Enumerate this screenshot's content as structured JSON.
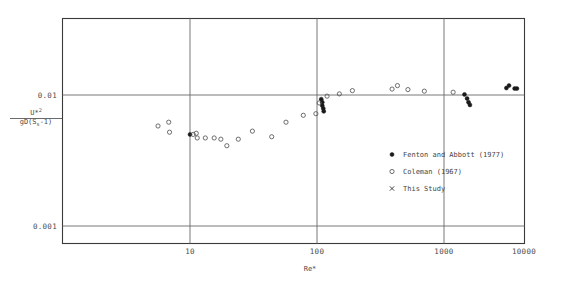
{
  "chart_data": {
    "type": "scatter",
    "title": "",
    "xlabel": "Re*",
    "ylabel_numerator": "U*",
    "ylabel_numerator_exp": "2",
    "ylabel_denominator_pre": "gD(S",
    "ylabel_denominator_sub": "s",
    "ylabel_denominator_post": "-1)",
    "xscale": "log",
    "yscale": "log",
    "xlim": [
      3,
      10000
    ],
    "ylim": [
      0.0007,
      0.05
    ],
    "grid": true,
    "legend_position": "center-right",
    "xticks": [
      "10",
      "100",
      "1000",
      "10000"
    ],
    "xtick_values": [
      10,
      100,
      1000,
      10000
    ],
    "yticks": [
      "0.01",
      "0.001"
    ],
    "ytick_values": [
      0.01,
      0.001
    ],
    "series": [
      {
        "name": "Fenton and Abbott (1977)",
        "marker": "filled-circle",
        "color": "#1a1a1a",
        "points": [
          [
            10.0,
            0.005
          ],
          [
            108.0,
            0.0093
          ],
          [
            110.0,
            0.0088
          ],
          [
            110.0,
            0.0083
          ],
          [
            112.0,
            0.0079
          ],
          [
            113.0,
            0.0075
          ],
          [
            1450.0,
            0.0101
          ],
          [
            1520.0,
            0.0094
          ],
          [
            1560.0,
            0.0088
          ],
          [
            1600.0,
            0.0084
          ],
          [
            3100.0,
            0.0113
          ],
          [
            3250.0,
            0.0118
          ],
          [
            3600.0,
            0.0112
          ],
          [
            3750.0,
            0.0112
          ]
        ]
      },
      {
        "name": "Coleman (1967)",
        "marker": "open-circle",
        "color": "#555555",
        "points": [
          [
            5.6,
            0.0058
          ],
          [
            6.8,
            0.0062
          ],
          [
            6.9,
            0.0052
          ],
          [
            10.6,
            0.005
          ],
          [
            11.2,
            0.0051
          ],
          [
            11.4,
            0.0047
          ],
          [
            13.2,
            0.0047
          ],
          [
            15.5,
            0.0047
          ],
          [
            17.5,
            0.0046
          ],
          [
            19.5,
            0.0041
          ],
          [
            24.0,
            0.0046
          ],
          [
            31.0,
            0.0053
          ],
          [
            44.0,
            0.0048
          ],
          [
            57.0,
            0.0062
          ],
          [
            78.0,
            0.007
          ],
          [
            98.0,
            0.0072
          ],
          [
            104.0,
            0.0087
          ],
          [
            120.0,
            0.0098
          ],
          [
            150.0,
            0.0102
          ],
          [
            190.0,
            0.0108
          ],
          [
            390.0,
            0.0111
          ],
          [
            430.0,
            0.0118
          ],
          [
            520.0,
            0.011
          ],
          [
            700.0,
            0.0107
          ],
          [
            1180.0,
            0.0105
          ]
        ]
      },
      {
        "name": "This Study",
        "marker": "cross",
        "color": "#333333",
        "points": []
      }
    ]
  },
  "legend": {
    "entries": [
      {
        "label": "Fenton and Abbott (1977)",
        "marker": "filled-circle"
      },
      {
        "label": "Coleman (1967)",
        "marker": "open-circle"
      },
      {
        "label": "This Study",
        "marker": "cross"
      }
    ]
  },
  "axes": {
    "x_title": "Re*",
    "y_tick_upper": "0.01",
    "y_tick_lower": "0.001",
    "x_tick_1": "10",
    "x_tick_2": "100",
    "x_tick_3": "1000",
    "x_tick_4": "10000"
  }
}
